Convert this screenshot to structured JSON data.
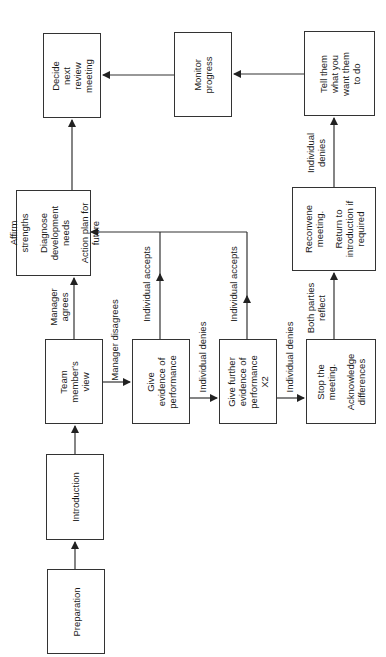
{
  "diagram": {
    "orientation": "rotated 90° counter-clockwise",
    "nodes": {
      "preparation": {
        "lines": [
          "Preparation"
        ]
      },
      "introduction": {
        "lines": [
          "Introduction"
        ]
      },
      "team_view": {
        "lines": [
          "Team",
          "member's",
          "view"
        ]
      },
      "affirm": {
        "para1": [
          "Affirm",
          "strengths"
        ],
        "para2": [
          "Diagnose",
          "development",
          "needs"
        ],
        "para3": [
          "Action plan for",
          "future"
        ]
      },
      "decide": {
        "lines": [
          "Decide",
          "next",
          "review",
          "meeting"
        ]
      },
      "give_evidence": {
        "lines": [
          "Give",
          "evidence of",
          "performance"
        ]
      },
      "give_further": {
        "lines": [
          "Give further",
          "evidence of",
          "performance",
          "X2"
        ]
      },
      "stop": {
        "para1": [
          "Stop the",
          "meeting."
        ],
        "para2": [
          "Acknowledge",
          "differences"
        ]
      },
      "reconvene": {
        "para1": [
          "Reconvene",
          "meeting."
        ],
        "para2": [
          "Return to",
          "introduction if",
          "required"
        ]
      },
      "tell": {
        "lines": [
          "Tell them",
          "what you",
          "want them",
          "to do"
        ]
      },
      "monitor": {
        "lines": [
          "Monitor",
          "progress"
        ]
      }
    },
    "edge_labels": {
      "manager_agrees": [
        "Manager",
        "agrees"
      ],
      "manager_disagrees": "Manager disagrees",
      "accepts_1": "Individual accepts",
      "denies_1": "Individual denies",
      "accepts_2": "Individual accepts",
      "denies_2": "Individual denies",
      "both_reflect": [
        "Both parties",
        "reflect"
      ],
      "denies_3": [
        "Individual",
        "denies"
      ]
    },
    "colors": {
      "line": "#333333",
      "background": "#ffffff"
    }
  }
}
